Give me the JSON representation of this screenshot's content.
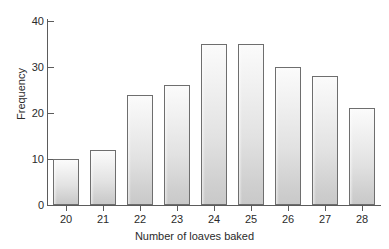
{
  "chart_data": {
    "type": "bar",
    "title": "",
    "xlabel": "Number of loaves baked",
    "ylabel": "Frequency",
    "categories": [
      "20",
      "21",
      "22",
      "23",
      "24",
      "25",
      "26",
      "27",
      "28"
    ],
    "values": [
      10,
      12,
      24,
      26,
      35,
      35,
      30,
      28,
      21
    ],
    "ylim": [
      0,
      40
    ],
    "yticks": [
      "0",
      "10",
      "20",
      "30",
      "40"
    ],
    "grid": false,
    "legend": null,
    "bar_fill_top": "#fbfbfb",
    "bar_fill_bottom": "#c9c9c9",
    "bar_border": "#6e6e6e",
    "axis_color": "#5b5b5b",
    "text_color": "#2b2b2b"
  },
  "artifacts": {
    "bleed_line_1": "",
    "bleed_line_2": ""
  }
}
